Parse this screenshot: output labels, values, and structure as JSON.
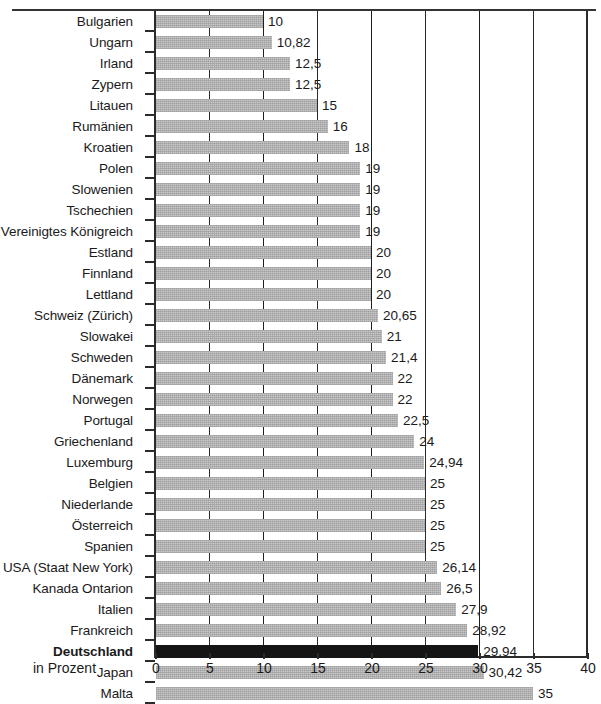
{
  "chart_data": {
    "type": "bar",
    "orientation": "horizontal",
    "title": "",
    "subtitle": "",
    "xlabel": "in Prozent",
    "ylabel": "",
    "xlim": [
      0,
      40
    ],
    "xticks": [
      0,
      5,
      10,
      15,
      20,
      25,
      30,
      35,
      40
    ],
    "xtick_labels": [
      "0",
      "5",
      "10",
      "15",
      "20",
      "25",
      "30",
      "35",
      "40"
    ],
    "grid": true,
    "grid_axis": "x",
    "legend": false,
    "decimal_separator": ",",
    "categories": [
      "Bulgarien",
      "Ungarn",
      "Irland",
      "Zypern",
      "Litauen",
      "Rumänien",
      "Kroatien",
      "Polen",
      "Slowenien",
      "Tschechien",
      "Vereinigtes Königreich",
      "Estland",
      "Finnland",
      "Lettland",
      "Schweiz (Zürich)",
      "Slowakei",
      "Schweden",
      "Dänemark",
      "Norwegen",
      "Portugal",
      "Griechenland",
      "Luxemburg",
      "Belgien",
      "Niederlande",
      "Österreich",
      "Spanien",
      "USA (Staat New York)",
      "Kanada Ontarion",
      "Italien",
      "Frankreich",
      "Deutschland",
      "Japan",
      "Malta"
    ],
    "values": [
      10,
      10.82,
      12.5,
      12.5,
      15,
      16,
      18,
      19,
      19,
      19,
      19,
      20,
      20,
      20,
      20.65,
      21,
      21.4,
      22,
      22,
      22.5,
      24,
      24.94,
      25,
      25,
      25,
      25,
      26.14,
      26.5,
      27.9,
      28.92,
      29.94,
      30.42,
      35
    ],
    "value_labels": [
      "10",
      "10,82",
      "12,5",
      "12,5",
      "15",
      "16",
      "18",
      "19",
      "19",
      "19",
      "19",
      "20",
      "20",
      "20",
      "20,65",
      "21",
      "21,4",
      "22",
      "22",
      "22,5",
      "24",
      "24,94",
      "25",
      "25",
      "25",
      "25",
      "26,14",
      "26,5",
      "27,9",
      "28,92",
      "29,94",
      "30,42",
      "35"
    ],
    "highlight_category": "Deutschland",
    "colors": {
      "bar": "#c9c9c9",
      "bar_highlight": "#151515",
      "axis": "#2b2b2b",
      "grid": "#2b2b2b",
      "text": "#1a1a1a",
      "background": "#ffffff"
    }
  }
}
